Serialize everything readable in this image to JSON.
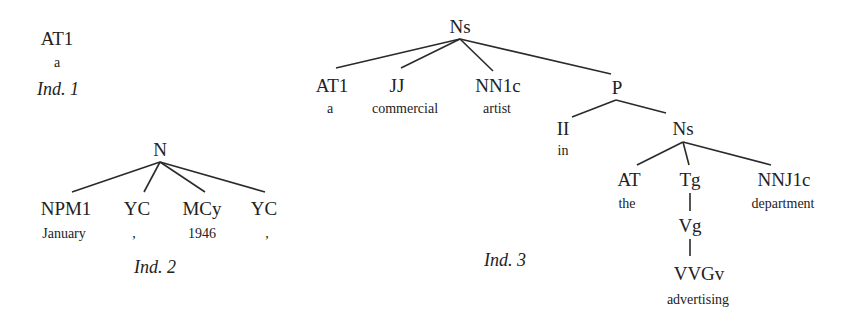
{
  "diagram": {
    "type": "parse-tree-figure",
    "trees": [
      {
        "caption": "Ind. 1",
        "nodes": [
          {
            "tag": "AT1",
            "word": "a"
          }
        ]
      },
      {
        "caption": "Ind. 2",
        "root": "N",
        "children": [
          {
            "tag": "NPM1",
            "word": "January"
          },
          {
            "tag": "YC",
            "word": ","
          },
          {
            "tag": "MCy",
            "word": "1946"
          },
          {
            "tag": "YC",
            "word": ","
          }
        ]
      },
      {
        "caption": "Ind. 3",
        "root": "Ns",
        "children": [
          {
            "tag": "AT1",
            "word": "a"
          },
          {
            "tag": "JJ",
            "word": "commercial"
          },
          {
            "tag": "NN1c",
            "word": "artist"
          },
          {
            "tag": "P",
            "children": [
              {
                "tag": "II",
                "word": "in"
              },
              {
                "tag": "Ns",
                "children": [
                  {
                    "tag": "AT",
                    "word": "the"
                  },
                  {
                    "tag": "Tg",
                    "children": [
                      {
                        "tag": "Vg",
                        "children": [
                          {
                            "tag": "VVGv",
                            "word": "advertising"
                          }
                        ]
                      }
                    ]
                  },
                  {
                    "tag": "NNJ1c",
                    "word": "department"
                  }
                ]
              }
            ]
          }
        ]
      }
    ]
  },
  "colors": {
    "line": "#2a2a2a",
    "text": "#222222",
    "background": "#ffffff"
  }
}
